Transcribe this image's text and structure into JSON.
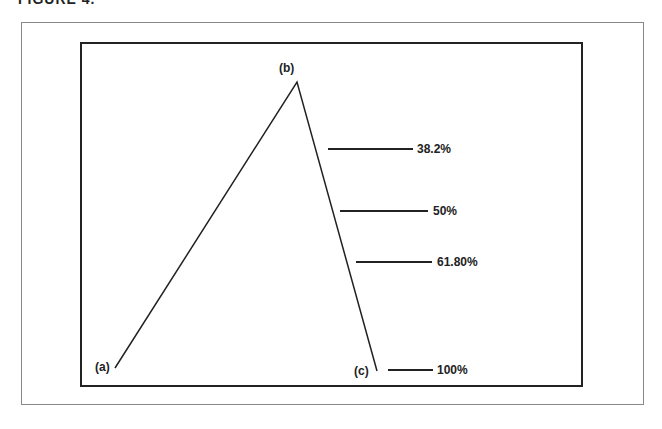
{
  "caption": "FIGURE 4.",
  "points": {
    "a": {
      "label": "(a)",
      "x": 115,
      "y": 368
    },
    "b": {
      "label": "(b)",
      "x": 297,
      "y": 82
    },
    "c": {
      "label": "(c)",
      "x": 377,
      "y": 371
    }
  },
  "retracements": [
    {
      "label": "38.2%",
      "x1": 328,
      "x2": 413,
      "y": 149
    },
    {
      "label": "50%",
      "x1": 340,
      "x2": 428,
      "y": 211
    },
    {
      "label": "61.80%",
      "x1": 356,
      "x2": 432,
      "y": 262
    },
    {
      "label": "100%",
      "x1": 388,
      "x2": 433,
      "y": 370
    }
  ],
  "colors": {
    "line": "#222222",
    "frame": "#888888",
    "background": "#ffffff"
  }
}
